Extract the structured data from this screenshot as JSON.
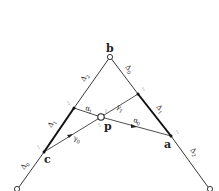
{
  "diagram": {
    "points": {
      "b": {
        "label": "b",
        "x": 110,
        "y": 57
      },
      "p": {
        "label": "p",
        "x": 101,
        "y": 117
      },
      "a": {
        "label": "a",
        "x": 171,
        "y": 136
      },
      "c": {
        "label": "c",
        "x": 44,
        "y": 152
      },
      "left_end": {
        "x": 17,
        "y": 189
      },
      "right_end": {
        "x": 210,
        "y": 189
      },
      "left_mid": {
        "x": 74,
        "y": 108
      },
      "right_mid": {
        "x": 138,
        "y": 94
      }
    },
    "edge_labels": {
      "delta2_left": {
        "sym": "Δ",
        "sub": "2"
      },
      "delta1_left": {
        "sym": "Δ",
        "sub": "1"
      },
      "delta0_left": {
        "sym": "Δ",
        "sub": "0"
      },
      "delta0_right": {
        "sym": "Δ",
        "sub": "0"
      },
      "delta1_right": {
        "sym": "Δ",
        "sub": "1"
      },
      "delta2_right": {
        "sym": "Δ",
        "sub": "2"
      }
    },
    "ray_labels": {
      "alpha1": {
        "sym": "α",
        "sub": "1"
      },
      "alpha0": {
        "sym": "α",
        "sub": "0"
      },
      "gamma1": {
        "sym": "γ",
        "sub": "1"
      },
      "gamma0": {
        "sym": "γ",
        "sub": "0"
      }
    },
    "colors": {
      "line": "#222222",
      "background": "#ffffff"
    }
  }
}
